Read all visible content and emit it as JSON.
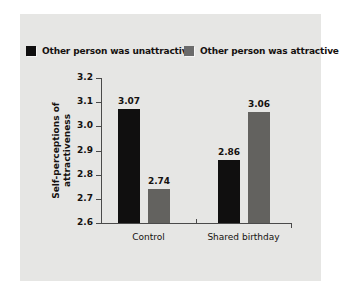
{
  "chart_data": {
    "type": "bar",
    "title": "",
    "subtitle": "",
    "xlabel": "",
    "ylabel": "Self-perceptions of attractiveness",
    "ylabel_lines": [
      "Self-perceptions of",
      "attractiveness"
    ],
    "categories": [
      "Control",
      "Shared birthday"
    ],
    "series": [
      {
        "name": "Other person was unattractive",
        "color": "#100f0f",
        "values": [
          3.07,
          2.86
        ],
        "labels": [
          "3.07",
          "2.86"
        ]
      },
      {
        "name": "Other person was attractive",
        "color": "#63625f",
        "values": [
          2.74,
          3.06
        ],
        "labels": [
          "2.74",
          "3.06"
        ]
      }
    ],
    "ylim": [
      2.6,
      3.2
    ],
    "ytick_step": 0.1,
    "yticks": [
      3.2,
      3.1,
      3.0,
      2.9,
      2.8,
      2.7,
      2.6
    ],
    "ytick_labels": [
      "3.2",
      "3.1",
      "3.0",
      "2.9",
      "2.8",
      "2.7",
      "2.6"
    ],
    "grid": false,
    "legend_position": "top"
  },
  "legend": {
    "items": [
      {
        "label": "Other person was unattractive",
        "swatch": "dark-swatch-icon",
        "color": "#100f0f"
      },
      {
        "label": "Other person was attractive",
        "swatch": "gray-swatch-icon",
        "color": "#63625f"
      }
    ]
  },
  "colors": {
    "panel_background": "#e6e6e4",
    "page_background": "#ffffff",
    "axis": "#4a4a4a",
    "text": "#15110f",
    "bar_dark": "#100f0f",
    "bar_gray": "#63625f"
  }
}
